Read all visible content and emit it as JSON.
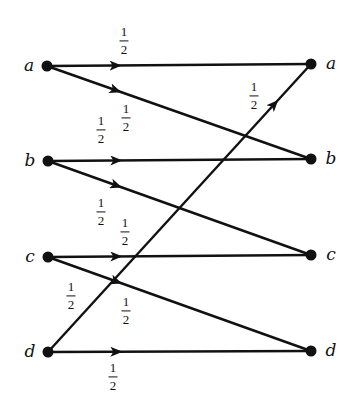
{
  "diagram": {
    "type": "bipartite-transition-graph",
    "colors": {
      "ink": "#111111",
      "background": "#ffffff"
    },
    "left_nodes": [
      {
        "id": "a",
        "label": "a",
        "x": 47,
        "y": 66
      },
      {
        "id": "b",
        "label": "b",
        "x": 48,
        "y": 161
      },
      {
        "id": "c",
        "label": "c",
        "x": 48,
        "y": 257
      },
      {
        "id": "d",
        "label": "d",
        "x": 48,
        "y": 352
      }
    ],
    "right_nodes": [
      {
        "id": "a",
        "label": "a",
        "x": 311,
        "y": 64
      },
      {
        "id": "b",
        "label": "b",
        "x": 311,
        "y": 159
      },
      {
        "id": "c",
        "label": "c",
        "x": 311,
        "y": 255
      },
      {
        "id": "d",
        "label": "d",
        "x": 311,
        "y": 351
      }
    ],
    "edges": [
      {
        "from": "a",
        "to": "a",
        "weight": "1/2",
        "num": "1",
        "den": "2",
        "label_x": 124,
        "label_y": 41
      },
      {
        "from": "a",
        "to": "b",
        "weight": "1/2",
        "num": "1",
        "den": "2",
        "label_x": 126,
        "label_y": 118
      },
      {
        "from": "b",
        "to": "b",
        "weight": "1/2",
        "num": "1",
        "den": "2",
        "label_x": 101,
        "label_y": 130
      },
      {
        "from": "b",
        "to": "c",
        "weight": "1/2",
        "num": "1",
        "den": "2",
        "label_x": 101,
        "label_y": 212
      },
      {
        "from": "c",
        "to": "c",
        "weight": "1/2",
        "num": "1",
        "den": "2",
        "label_x": 125,
        "label_y": 232
      },
      {
        "from": "c",
        "to": "d",
        "weight": "1/2",
        "num": "1",
        "den": "2",
        "label_x": 126,
        "label_y": 311
      },
      {
        "from": "d",
        "to": "a",
        "weight": "1/2",
        "num": "1",
        "den": "2",
        "label_x": 254,
        "label_y": 96
      },
      {
        "from": "d",
        "to": "d",
        "weight": "1/2",
        "num": "1",
        "den": "2",
        "label_x": 113,
        "label_y": 377
      }
    ],
    "extra_labels": [
      {
        "for_edge": "d->a",
        "num": "1",
        "den": "2",
        "x": 71,
        "y": 296
      }
    ]
  }
}
